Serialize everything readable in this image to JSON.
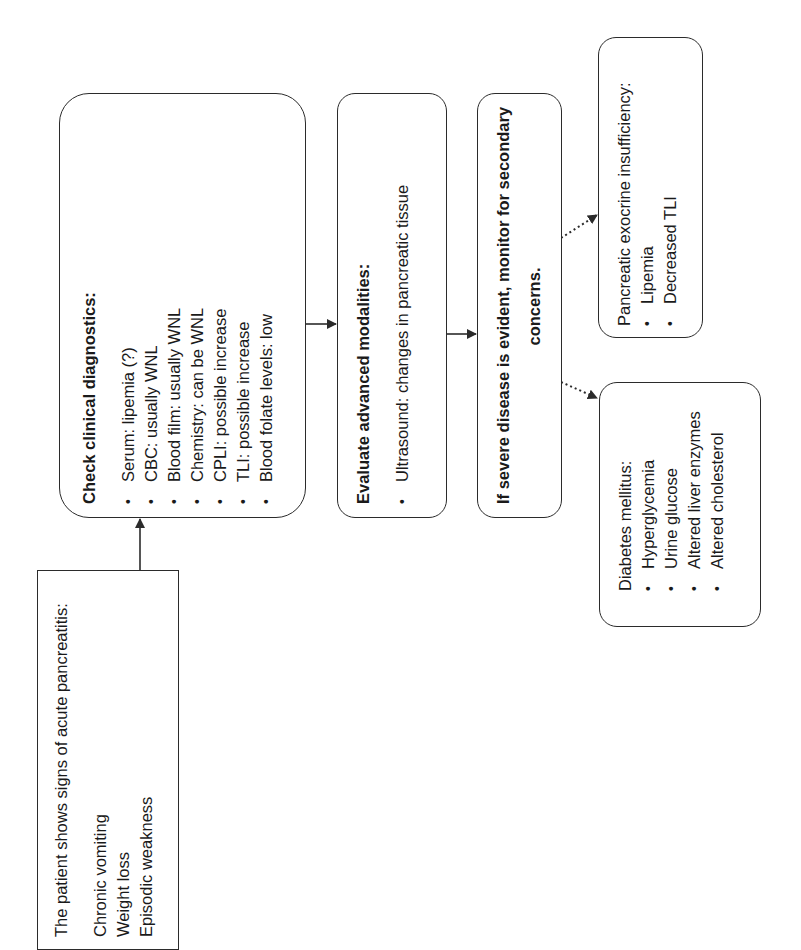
{
  "orientation": "rotated-90-ccw",
  "nodes": {
    "patient_signs": {
      "title": "The patient shows signs of acute pancreatitis:",
      "items": [
        "Chronic vomiting",
        "Weight loss",
        "Episodic weakness"
      ]
    },
    "clinical_diagnostics": {
      "title": "Check clinical diagnostics:",
      "items": [
        "Serum: lipemia (?)",
        "CBC: usually WNL",
        "Blood film: usually WNL",
        "Chemistry: can be WNL",
        "CPLI: possible increase",
        "TLI: possible increase",
        "Blood folate levels: low"
      ]
    },
    "advanced_modalities": {
      "title": "Evaluate advanced modalities:",
      "items": [
        "Ultrasound: changes in pancreatic tissue"
      ]
    },
    "severe_disease": {
      "title_line1": "If severe disease is evident, monitor for secondary",
      "title_line2": "concerns."
    },
    "exocrine_insufficiency": {
      "title": "Pancreatic exocrine insufficiency:",
      "items": [
        "Lipemia",
        "Decreased TLI"
      ]
    },
    "diabetes": {
      "title": "Diabetes mellitus:",
      "items": [
        "Hyperglycemia",
        "Urine glucose",
        "Altered liver enzymes",
        "Altered cholesterol"
      ]
    }
  },
  "edges": [
    {
      "from": "patient_signs",
      "to": "clinical_diagnostics",
      "style": "solid"
    },
    {
      "from": "clinical_diagnostics",
      "to": "advanced_modalities",
      "style": "solid"
    },
    {
      "from": "advanced_modalities",
      "to": "severe_disease",
      "style": "solid"
    },
    {
      "from": "severe_disease",
      "to": "exocrine_insufficiency",
      "style": "dotted"
    },
    {
      "from": "severe_disease",
      "to": "diabetes",
      "style": "dotted"
    }
  ],
  "bullet_glyph": "•",
  "colors": {
    "stroke": "#2b2b2b",
    "text": "#1a1a1a",
    "background": "#ffffff"
  }
}
